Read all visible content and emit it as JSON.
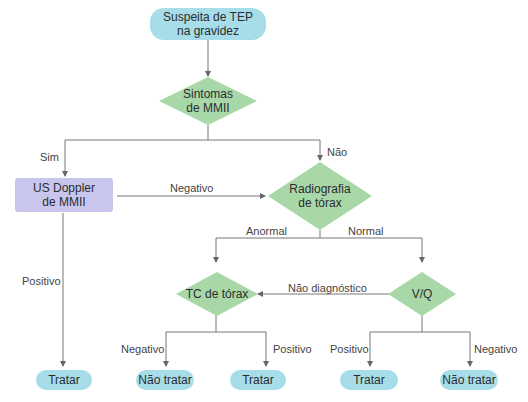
{
  "colors": {
    "terminal_fill": "#a6dde8",
    "process_fill": "#c9c6ee",
    "decision_fill": "#a8d8a8",
    "line": "#666666"
  },
  "nodes": {
    "start": "Suspeita de TEP na gravidez",
    "start_line1": "Suspeita de TEP",
    "start_line2": "na gravidez",
    "symptoms_line1": "Sintomas",
    "symptoms_line2": "de MMII",
    "doppler_line1": "US Doppler",
    "doppler_line2": "de MMII",
    "xray_line1": "Radiografia",
    "xray_line2": "de tórax",
    "ct": "TC de tórax",
    "vq": "V/Q",
    "end1": "Tratar",
    "end2": "Não tratar",
    "end3": "Tratar",
    "end4": "Tratar",
    "end5": "Não tratar"
  },
  "edges": {
    "sim": "Sim",
    "nao": "Não",
    "negativo_doppler": "Negativo",
    "positivo_doppler": "Positivo",
    "anormal": "Anormal",
    "normal": "Normal",
    "nao_diagnostico": "Não diagnóstico",
    "ct_negativo": "Negativo",
    "ct_positivo": "Positivo",
    "vq_positivo": "Positivo",
    "vq_negativo": "Negativo"
  }
}
